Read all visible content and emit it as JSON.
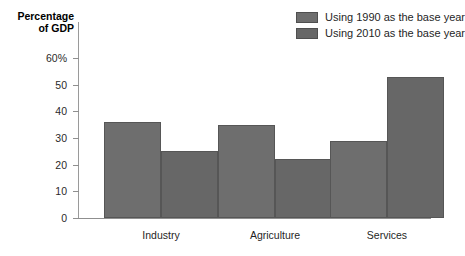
{
  "chart_data": {
    "type": "bar",
    "title": "",
    "subtitle": "",
    "xlabel": "",
    "ylabel": "Percentage of GDP",
    "ylabel_lines": [
      "Percentage",
      "of GDP"
    ],
    "categories": [
      "Industry",
      "Agriculture",
      "Services"
    ],
    "series": [
      {
        "name": "Using 1990 as the base year",
        "color": "#6e6e6e",
        "values": [
          36,
          35,
          29
        ]
      },
      {
        "name": "Using 2010 as the base year",
        "color": "#676767",
        "values": [
          25,
          22,
          53
        ]
      }
    ],
    "ylim": [
      0,
      60
    ],
    "ytick_values": [
      0,
      10,
      20,
      30,
      40,
      50,
      60
    ],
    "ytick_labels": [
      "0",
      "10",
      "20",
      "30",
      "40",
      "50",
      "60%"
    ],
    "grid": false,
    "legend_position": "top-right",
    "annotations": []
  },
  "legend": {
    "items": [
      {
        "label": "Using 1990 as the base year",
        "color": "#6e6e6e"
      },
      {
        "label": "Using 2010 as the base year",
        "color": "#676767"
      }
    ]
  },
  "colors": {
    "series1": "#6e6e6e",
    "series2": "#676767",
    "bar_outline": "#565656",
    "axis": "#8f8f8f",
    "text": "#1f1f1f",
    "background": "#ffffff"
  }
}
